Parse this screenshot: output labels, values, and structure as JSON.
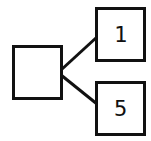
{
  "diagram": {
    "type": "tree",
    "root": {
      "label": ""
    },
    "children": [
      {
        "label": "1"
      },
      {
        "label": "5"
      }
    ],
    "colors": {
      "stroke": "#111111",
      "fill": "#ffffff"
    }
  }
}
